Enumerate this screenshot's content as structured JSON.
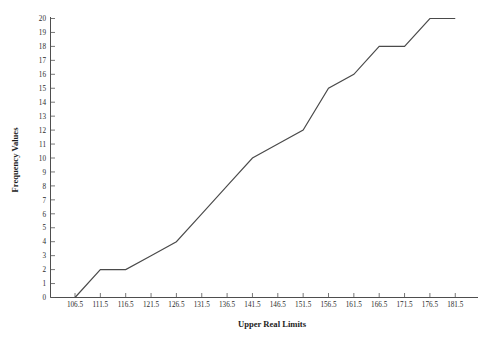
{
  "chart_data": {
    "type": "line",
    "title": "",
    "subtitle": "",
    "xlabel": "Upper Real Limits",
    "ylabel": "Frequency Values",
    "x": [
      106.5,
      111.5,
      116.5,
      121.5,
      126.5,
      131.5,
      136.5,
      141.5,
      146.5,
      151.5,
      156.5,
      161.5,
      166.5,
      171.5,
      176.5,
      181.5
    ],
    "xticklabels": [
      "106.5",
      "111.5",
      "116.5",
      "121.5",
      "126.5",
      "131.5",
      "136.5",
      "141.5",
      "146.5",
      "151.5",
      "156.5",
      "161.5",
      "166.5",
      "171.5",
      "176.5",
      "181.5"
    ],
    "values": [
      0,
      2,
      2,
      3,
      4,
      6,
      8,
      10,
      11,
      12,
      15,
      16,
      18,
      18,
      20,
      20
    ],
    "yticklabels": [
      "0",
      "1",
      "2",
      "3",
      "4",
      "5",
      "6",
      "7",
      "8",
      "9",
      "10",
      "11",
      "12",
      "13",
      "14",
      "15",
      "16",
      "17",
      "18",
      "19",
      "20"
    ],
    "yticks": [
      0,
      1,
      2,
      3,
      4,
      5,
      6,
      7,
      8,
      9,
      10,
      11,
      12,
      13,
      14,
      15,
      16,
      17,
      18,
      19,
      20
    ],
    "ylim": [
      0,
      20
    ],
    "xlim": [
      104.0,
      184.0
    ],
    "grid": false,
    "legend": false,
    "legend_position": "none",
    "series": [
      {
        "name": "Cumulative Frequency",
        "values": [
          0,
          2,
          2,
          3,
          4,
          6,
          8,
          10,
          11,
          12,
          15,
          16,
          18,
          18,
          20,
          20
        ]
      }
    ],
    "line_color": "#4a4a4a",
    "axis_color": "#3a3a3a",
    "background_color": "#ffffff"
  }
}
